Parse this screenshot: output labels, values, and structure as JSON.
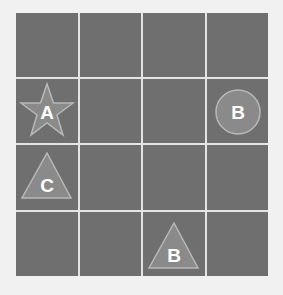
{
  "board": {
    "rows": 4,
    "cols": 4,
    "colors": {
      "background": "#f1f1f1",
      "cell": "#6f6f6f",
      "gridline": "#e4e4e4",
      "piece_fill": "#8a8a8a",
      "piece_stroke": "#b8b8b8",
      "label": "#ffffff"
    },
    "pieces": [
      {
        "shape": "star",
        "label": "A",
        "row": 2,
        "col": 1
      },
      {
        "shape": "circle",
        "label": "B",
        "row": 2,
        "col": 4
      },
      {
        "shape": "triangle",
        "label": "C",
        "row": 3,
        "col": 1
      },
      {
        "shape": "triangle",
        "label": "B",
        "row": 4,
        "col": 3
      }
    ]
  }
}
